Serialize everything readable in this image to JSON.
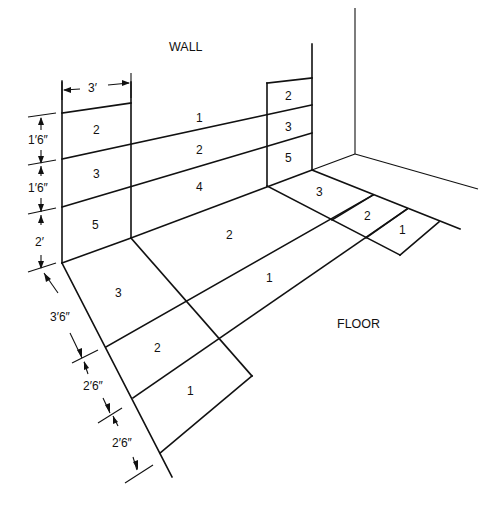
{
  "labels": {
    "wall": "WALL",
    "floor": "FLOOR"
  },
  "dimensions": {
    "width_top": "3′",
    "wall_row1": "1′6″",
    "wall_row2": "1′6″",
    "wall_row3": "2′",
    "floor_row1": "3′6″",
    "floor_row2": "2′6″",
    "floor_row3": "2′6″"
  },
  "left_wall_panel": [
    "2",
    "3",
    "5"
  ],
  "wall_strips": [
    "1",
    "2",
    "4"
  ],
  "right_wall_panel": [
    "2",
    "3",
    "5"
  ],
  "floor_center": [
    "2",
    "1"
  ],
  "left_floor_panel": [
    "3",
    "2",
    "1"
  ],
  "right_floor_panel": [
    "3",
    "2",
    "1"
  ]
}
